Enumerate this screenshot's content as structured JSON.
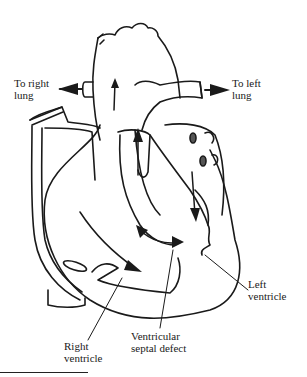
{
  "diagram": {
    "colors": {
      "line": "#1a1a1a",
      "background": "#ffffff"
    },
    "labels": {
      "right_lung": {
        "line1": "To right",
        "line2": "lung"
      },
      "left_lung": {
        "line1": "To left",
        "line2": "lung"
      },
      "left_ventricle": {
        "line1": "Left",
        "line2": "ventricle"
      },
      "right_ventricle": {
        "line1": "Right",
        "line2": "ventricle"
      },
      "vsd": {
        "line1": "Ventricular",
        "line2": "septal defect"
      }
    }
  }
}
